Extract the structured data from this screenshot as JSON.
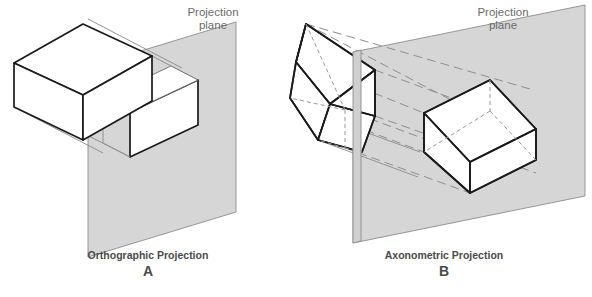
{
  "figure": {
    "background_color": "#ffffff",
    "width": 592,
    "height": 297
  },
  "colors": {
    "plane_fill": "#d6d6d6",
    "plane_front_fill": "#cfcfcf",
    "solid_edge": "#1a1a1a",
    "hidden_edge": "#9a9a9a",
    "projector_line": "#8e8e8e",
    "label_text": "#6b6b6b",
    "caption_text": "#4a4a4a"
  },
  "panels": [
    {
      "id": "A",
      "caption_title": "Orthographic Projection",
      "caption_letter": "A",
      "plane_label_line1": "Projection",
      "plane_label_line2": "plane",
      "object_name": "rectangular-prism",
      "projection_type": "orthographic",
      "description_parts": {
        "object": "rectangular box shown in isometric view at upper left",
        "plane": "shaded projection plane parallelogram",
        "image": "white rectangular face projected onto plane",
        "projectors": "light gray parallel projector lines perpendicular to plane"
      }
    },
    {
      "id": "B",
      "caption_title": "Axonometric Projection",
      "caption_letter": "B",
      "plane_label_line1": "Projection",
      "plane_label_line2": "plane",
      "object_name": "tilted-rectangular-prism",
      "projection_type": "axonometric",
      "description_parts": {
        "object": "rectangular box tilted obliquely at upper left with dashed hidden edges",
        "plane": "shaded projection plane parallelogram",
        "image": "isometric box image formed on the plane with dashed hidden edges",
        "projectors": "long dashed parallel projector lines running to the plane"
      }
    }
  ],
  "icons": {
    "plane_label": "projection-plane-label"
  }
}
